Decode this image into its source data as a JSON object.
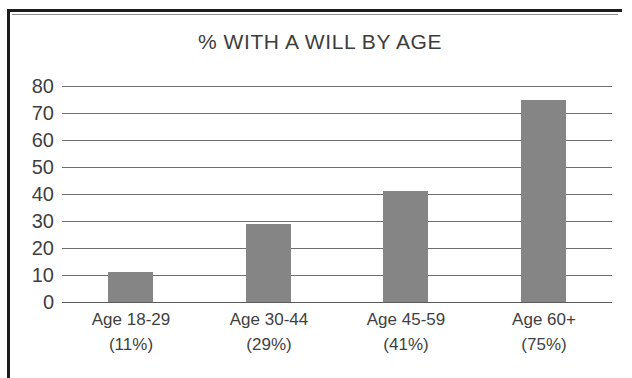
{
  "chart_data": {
    "type": "bar",
    "title": "% WITH A WILL BY AGE",
    "xlabel": "",
    "ylabel": "",
    "categories": [
      "Age 18-29",
      "Age 30-44",
      "Age 45-59",
      "Age 60+"
    ],
    "category_sublabels": [
      "(11%)",
      "(29%)",
      "(41%)",
      "(75%)"
    ],
    "values": [
      11,
      29,
      41,
      75
    ],
    "ylim": [
      0,
      80
    ],
    "ytick_labels": [
      "80",
      "70",
      "60",
      "50",
      "40",
      "30",
      "20",
      "10",
      "0"
    ],
    "ytick_values": [
      80,
      70,
      60,
      50,
      40,
      30,
      20,
      10,
      0
    ],
    "grid": true,
    "legend": "none",
    "bar_color": "#858585",
    "gridline_color": "#6f6f6f",
    "text_color": "#3f3f3f",
    "background_color": "#ffffff",
    "frame_color": "#1d1d1d"
  }
}
